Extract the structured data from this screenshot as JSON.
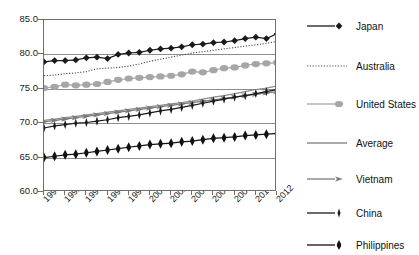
{
  "chart_data": {
    "type": "line",
    "title": "",
    "subtitle": "",
    "xlabel": "",
    "ylabel": "",
    "xlim": [
      1990,
      2012
    ],
    "ylim": [
      60.0,
      85.0
    ],
    "grid": true,
    "legend_position": "right",
    "x": [
      1990,
      1991,
      1992,
      1993,
      1994,
      1995,
      1996,
      1997,
      1998,
      1999,
      2000,
      2001,
      2002,
      2003,
      2004,
      2005,
      2006,
      2007,
      2008,
      2009,
      2010,
      2011,
      2012
    ],
    "categories": [
      "1990",
      "1991",
      "1992",
      "1993",
      "1994",
      "1995",
      "1996",
      "1997",
      "1998",
      "1999",
      "2000",
      "2001",
      "2002",
      "2003",
      "2004",
      "2005",
      "2006",
      "2007",
      "2008",
      "2009",
      "2010",
      "2011",
      "2012"
    ],
    "xtick_labels": [
      "1990",
      "1992",
      "1994",
      "1996",
      "1998",
      "2000",
      "2002",
      "2004",
      "2006",
      "2008",
      "2010",
      "2012"
    ],
    "ytick_labels": [
      "85.0",
      "80.0",
      "75.0",
      "70.0",
      "65.0",
      "60.0"
    ],
    "ytick_values": [
      85.0,
      80.0,
      75.0,
      70.0,
      65.0,
      60.0
    ],
    "series": [
      {
        "name": "Japan",
        "marker": "diamond",
        "line_style": "solid",
        "color": "#1a1a1a",
        "values": [
          78.9,
          79.1,
          79.1,
          79.2,
          79.5,
          79.6,
          79.4,
          80.0,
          80.2,
          80.3,
          80.6,
          80.8,
          80.9,
          81.1,
          81.4,
          81.5,
          81.7,
          81.8,
          82.0,
          82.3,
          82.5,
          82.3,
          83.0
        ]
      },
      {
        "name": "Australia",
        "marker": "none",
        "line_style": "dotted",
        "color": "#4d4d4d",
        "values": [
          76.9,
          77.0,
          77.2,
          77.3,
          77.5,
          77.9,
          78.0,
          78.1,
          78.3,
          78.6,
          79.0,
          79.3,
          79.6,
          79.9,
          80.2,
          80.4,
          80.6,
          80.8,
          81.0,
          81.2,
          81.4,
          81.6,
          81.9
        ]
      },
      {
        "name": "United States",
        "marker": "circle",
        "line_style": "solid",
        "color": "#a6a6a6",
        "values": [
          75.1,
          75.3,
          75.6,
          75.5,
          75.6,
          75.7,
          76.0,
          76.3,
          76.5,
          76.6,
          76.7,
          76.8,
          76.9,
          77.1,
          77.5,
          77.4,
          77.7,
          78.0,
          78.1,
          78.4,
          78.6,
          78.7,
          78.8
        ]
      },
      {
        "name": "Average",
        "marker": "none",
        "line_style": "solid",
        "color": "#8c8c8c",
        "values": [
          70.4,
          70.6,
          70.8,
          71.0,
          71.2,
          71.4,
          71.6,
          71.8,
          72.0,
          72.2,
          72.4,
          72.6,
          72.8,
          73.0,
          73.2,
          73.5,
          73.8,
          74.0,
          74.3,
          74.6,
          74.9,
          75.1,
          75.4
        ]
      },
      {
        "name": "Vietnam",
        "marker": "arrow",
        "line_style": "solid",
        "color": "#7a7a7a",
        "values": [
          70.2,
          70.4,
          70.6,
          70.8,
          71.0,
          71.2,
          71.4,
          71.6,
          71.8,
          72.0,
          72.2,
          72.4,
          72.6,
          72.8,
          73.0,
          73.2,
          73.4,
          73.6,
          73.8,
          74.0,
          74.2,
          74.4,
          74.6
        ]
      },
      {
        "name": "China",
        "marker": "vertical-bar",
        "line_style": "solid",
        "color": "#1a1a1a",
        "values": [
          69.3,
          69.6,
          69.8,
          70.0,
          70.1,
          70.3,
          70.5,
          70.8,
          71.0,
          71.2,
          71.5,
          71.8,
          72.0,
          72.3,
          72.6,
          72.9,
          73.2,
          73.5,
          73.8,
          74.0,
          74.3,
          74.6,
          74.9
        ]
      },
      {
        "name": "Philippines",
        "marker": "vertical-bar-bold",
        "line_style": "solid",
        "color": "#111111",
        "values": [
          65.0,
          65.2,
          65.4,
          65.5,
          65.7,
          65.9,
          66.1,
          66.3,
          66.5,
          66.7,
          66.9,
          67.0,
          67.1,
          67.3,
          67.4,
          67.6,
          67.8,
          67.9,
          68.0,
          68.2,
          68.3,
          68.4,
          68.5
        ]
      }
    ]
  },
  "legend": {
    "items": [
      {
        "label": "Japan"
      },
      {
        "label": "Australia"
      },
      {
        "label": "United States"
      },
      {
        "label": "Average"
      },
      {
        "label": "Vietnam"
      },
      {
        "label": "China"
      },
      {
        "label": "Philippines"
      }
    ]
  },
  "axes": {
    "y_labels": [
      "85.0",
      "80.0",
      "75.0",
      "70.0",
      "65.0",
      "60.0"
    ],
    "x_labels": [
      "1990",
      "1992",
      "1994",
      "1996",
      "1998",
      "2000",
      "2002",
      "2004",
      "2006",
      "2008",
      "2010",
      "2012"
    ]
  }
}
